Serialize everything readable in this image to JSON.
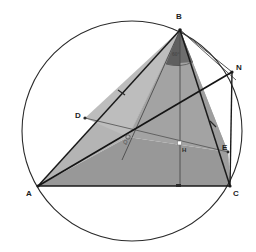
{
  "figure": {
    "background_color": "#ffffff",
    "stroke_color": "#1a1a1a",
    "thin_stroke_color": "#555555",
    "fill_light": "#b9b9b9",
    "fill_mid": "#989898",
    "fill_dark": "#6e6e6e",
    "circle": {
      "cx": 132,
      "cy": 131,
      "r": 110,
      "stroke": "#2a2a2a"
    }
  },
  "labels": {
    "A": "A",
    "B": "B",
    "C": "C",
    "D": "D",
    "E": "E",
    "N": "N",
    "H": "H",
    "Q": "Q",
    "angle_at_B": "60°"
  },
  "points": {
    "A": {
      "x": 38,
      "y": 186
    },
    "B": {
      "x": 180,
      "y": 30
    },
    "C": {
      "x": 230,
      "y": 186
    },
    "D": {
      "x": 85,
      "y": 118
    },
    "E": {
      "x": 228,
      "y": 152
    },
    "N": {
      "x": 232,
      "y": 72
    },
    "H": {
      "x": 180,
      "y": 144
    },
    "Q": {
      "x": 128,
      "y": 137
    }
  },
  "segments": [
    {
      "name": "AB",
      "from": "A",
      "to": "B"
    },
    {
      "name": "BC",
      "from": "B",
      "to": "C"
    },
    {
      "name": "AC",
      "from": "A",
      "to": "C"
    },
    {
      "name": "AN",
      "from": "A",
      "to": "N"
    },
    {
      "name": "BN",
      "from": "B",
      "to": "N"
    },
    {
      "name": "NC",
      "from": "N",
      "to": "C"
    },
    {
      "name": "BH",
      "from": "B",
      "to": "H"
    },
    {
      "name": "BQ",
      "from": "B",
      "to": "Q"
    },
    {
      "name": "DE",
      "from": "D",
      "to": "E"
    },
    {
      "name": "CD",
      "from": "C",
      "to": "D"
    }
  ],
  "tick_marks": [
    {
      "name": "tick-on-AB",
      "x": 122,
      "y": 91
    },
    {
      "name": "tick-on-AC",
      "x": 178,
      "y": 186
    },
    {
      "name": "tick-on-BC",
      "x": 213,
      "y": 124
    }
  ]
}
